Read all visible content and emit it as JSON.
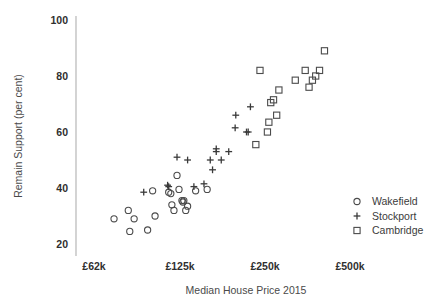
{
  "chart_data": {
    "type": "scatter",
    "title": "",
    "xlabel": "Median House Price 2015",
    "ylabel": "Remain Support (per cent)",
    "xscale": "log",
    "xticks": [
      "£62k",
      "£125k",
      "£250k",
      "£500k"
    ],
    "xtick_values": [
      62000,
      125000,
      250000,
      500000
    ],
    "yticks": [
      "100",
      "80",
      "60",
      "40",
      "20"
    ],
    "ytick_values": [
      100,
      80,
      60,
      40,
      20
    ],
    "ylim": [
      14,
      103
    ],
    "xlim": [
      50000,
      640000
    ],
    "grid": false,
    "legend_position": "bottom-right",
    "series": [
      {
        "name": "Wakefield",
        "marker": "circle",
        "color": "#4b4b4b",
        "points": [
          [
            73000,
            29.0
          ],
          [
            82000,
            32.0
          ],
          [
            83000,
            24.5
          ],
          [
            86000,
            29.0
          ],
          [
            96000,
            25.0
          ],
          [
            100000,
            39.0
          ],
          [
            102000,
            30.0
          ],
          [
            114000,
            38.5
          ],
          [
            116000,
            38.0
          ],
          [
            117000,
            34.0
          ],
          [
            119000,
            32.0
          ],
          [
            122000,
            44.5
          ],
          [
            124000,
            39.5
          ],
          [
            127000,
            35.5
          ],
          [
            128000,
            35.0
          ],
          [
            129000,
            35.5
          ],
          [
            131000,
            32.0
          ],
          [
            133000,
            33.5
          ],
          [
            142000,
            39.0
          ],
          [
            156000,
            39.5
          ]
        ]
      },
      {
        "name": "Stockport",
        "marker": "plus",
        "color": "#3a3a3a",
        "points": [
          [
            93000,
            38.5
          ],
          [
            113000,
            41.0
          ],
          [
            114000,
            40.5
          ],
          [
            122000,
            51.0
          ],
          [
            133000,
            50.0
          ],
          [
            140000,
            40.5
          ],
          [
            152000,
            41.5
          ],
          [
            160000,
            50.0
          ],
          [
            163000,
            46.5
          ],
          [
            168000,
            54.0
          ],
          [
            168000,
            53.0
          ],
          [
            175000,
            50.0
          ],
          [
            186000,
            53.0
          ],
          [
            196000,
            61.5
          ],
          [
            197000,
            66.0
          ],
          [
            215000,
            60.0
          ],
          [
            218000,
            60.0
          ],
          [
            222000,
            69.0
          ]
        ]
      },
      {
        "name": "Cambridge",
        "marker": "square",
        "color": "#4b4b4b",
        "points": [
          [
            232000,
            55.5
          ],
          [
            240000,
            82.0
          ],
          [
            255000,
            60.0
          ],
          [
            258000,
            63.5
          ],
          [
            262000,
            70.5
          ],
          [
            268000,
            71.5
          ],
          [
            275000,
            66.0
          ],
          [
            280000,
            75.0
          ],
          [
            320000,
            78.5
          ],
          [
            347000,
            82.0
          ],
          [
            358000,
            76.0
          ],
          [
            368000,
            78.5
          ],
          [
            378000,
            80.0
          ],
          [
            390000,
            82.0
          ],
          [
            406000,
            89.0
          ]
        ]
      }
    ]
  },
  "legend": {
    "items": [
      {
        "label": "Wakefield",
        "marker": "circle"
      },
      {
        "label": "Stockport",
        "marker": "plus"
      },
      {
        "label": "Cambridge",
        "marker": "square"
      }
    ]
  }
}
